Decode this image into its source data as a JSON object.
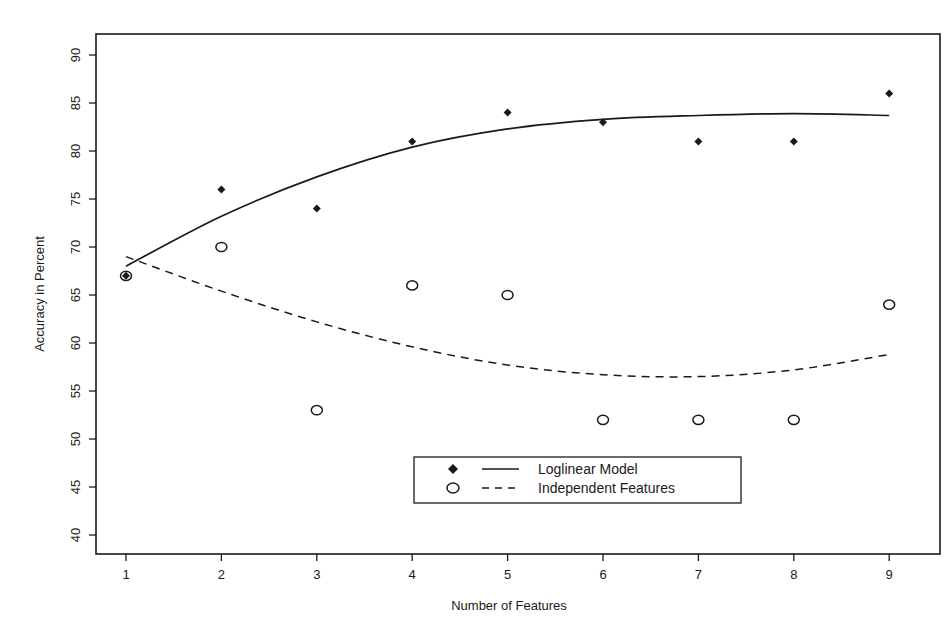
{
  "chart_data": {
    "type": "scatter",
    "title": "",
    "xlabel": "Number of Features",
    "ylabel": "Accuracy in Percent",
    "x": [
      1,
      2,
      3,
      4,
      5,
      6,
      7,
      8,
      9
    ],
    "xlim": [
      0.65,
      9.5
    ],
    "ylim": [
      38,
      92
    ],
    "xticks": [
      1,
      2,
      3,
      4,
      5,
      6,
      7,
      8,
      9
    ],
    "yticks": [
      40,
      45,
      50,
      55,
      60,
      65,
      70,
      75,
      80,
      85,
      90
    ],
    "grid": false,
    "legend_position": "lower center",
    "series": [
      {
        "name": "Loglinear Model",
        "marker": "filled-diamond",
        "line": "solid",
        "values": [
          67,
          76,
          74,
          81,
          84,
          83,
          81,
          81,
          86
        ],
        "fit": [
          68.0,
          73.2,
          77.3,
          80.4,
          82.3,
          83.3,
          83.7,
          83.9,
          83.7
        ]
      },
      {
        "name": "Independent Features",
        "marker": "open-circle",
        "line": "dashed",
        "values": [
          67,
          70,
          53,
          66,
          65,
          52,
          52,
          52,
          64
        ],
        "fit": [
          69.0,
          65.4,
          62.2,
          59.6,
          57.7,
          56.7,
          56.5,
          57.2,
          58.8
        ]
      }
    ]
  },
  "axes": {
    "x_title": "Number of Features",
    "y_title": "Accuracy in Percent",
    "x_tick_labels": [
      "1",
      "2",
      "3",
      "4",
      "5",
      "6",
      "7",
      "8",
      "9"
    ],
    "y_tick_labels": [
      "40",
      "45",
      "50",
      "55",
      "60",
      "65",
      "70",
      "75",
      "80",
      "85",
      "90"
    ]
  },
  "legend": {
    "items": [
      {
        "label": "Loglinear Model",
        "marker": "filled-diamond",
        "line": "solid"
      },
      {
        "label": "Independent Features",
        "marker": "open-circle",
        "line": "dashed"
      }
    ]
  },
  "colors": {
    "ink": "#1a1a1a",
    "background": "#ffffff"
  }
}
